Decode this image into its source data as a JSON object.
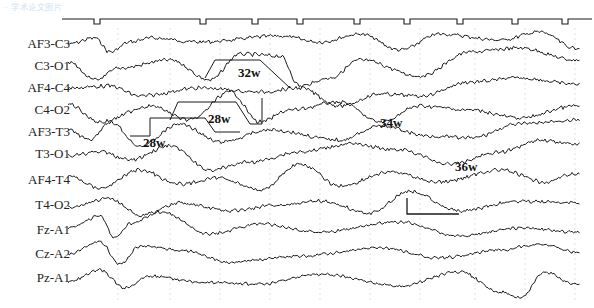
{
  "watermark": "·· 学术论文图片",
  "figure": {
    "channels": [
      "AF3-C3",
      "C3-O1",
      "AF4-C4",
      "C4-O2",
      "AF3-T3",
      "T3-O1",
      "AF4-T4",
      "T4-O2",
      "Fz-A1",
      "Cz-A2",
      "Pz-A1"
    ],
    "week_annotations": [
      {
        "label": "32w",
        "x": 238,
        "y": 66
      },
      {
        "label": "28w",
        "x": 208,
        "y": 112
      },
      {
        "label": "28w",
        "x": 143,
        "y": 136
      },
      {
        "label": "34w",
        "x": 380,
        "y": 116
      },
      {
        "label": "36w",
        "x": 455,
        "y": 160
      }
    ],
    "scale_bar": {
      "vertical_px": 16,
      "horizontal_px": 52
    },
    "trace_color": "#1a1a1a",
    "grid_color": "#d9d9d9"
  },
  "chart_data": {
    "type": "line",
    "title": "",
    "xlabel": "Time",
    "ylabel": "",
    "series_labels": [
      "AF3-C3",
      "C3-O1",
      "AF4-C4",
      "C4-O2",
      "AF3-T3",
      "T3-O1",
      "AF4-T4",
      "T4-O2",
      "Fz-A1",
      "Cz-A2",
      "Pz-A1"
    ],
    "annotations": [
      "32w",
      "28w",
      "28w",
      "34w",
      "36w"
    ],
    "timing_marks_x_px": [
      97,
      203,
      255,
      300,
      357,
      407,
      460,
      515,
      565
    ],
    "vertical_gridlines_x_px": [
      118,
      170,
      220,
      270,
      320,
      370,
      420,
      475,
      525,
      575
    ],
    "grid": true,
    "legend_position": "left (channel labels)"
  }
}
